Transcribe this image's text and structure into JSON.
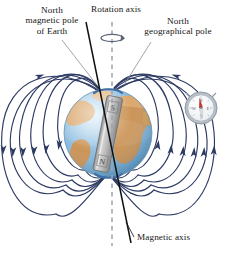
{
  "figure": {
    "background_color": "#ffffff"
  },
  "labels": {
    "magnetic_pole": {
      "line1": "North",
      "line2": "magnetic pole",
      "line3": "of Earth"
    },
    "rotation_axis": {
      "line1": "Rotation axis"
    },
    "geographical_pole": {
      "line1": "North",
      "line2": "geographical pole"
    },
    "magnetic_axis": {
      "line1": "Magnetic axis"
    }
  },
  "magnet": {
    "south_pole_marker": "S",
    "north_pole_marker": "N"
  },
  "compass": {
    "north_marker": "N",
    "east_marker": "E",
    "south_marker": "S",
    "west_marker": "W",
    "needle_color": "#c0392b"
  },
  "colors": {
    "field_line": "#2d3a63",
    "ocean": "#7fb5dc",
    "ocean_light": "#cfe4f2",
    "land": "#c58b4d",
    "land_light": "#e0b384",
    "magnetic_axis": "#111111",
    "rotation_axis": "#9aa2b4",
    "leader_line": "#8d8d8d",
    "magnet_body": "#b9b9b9",
    "compass_rim": "#9aa3ae"
  },
  "geometry": {
    "globe_center_x": 108,
    "globe_center_y": 133,
    "globe_radius": 44,
    "magnetic_axis_tilt_deg": 11,
    "rotation_axis_x": 112
  }
}
